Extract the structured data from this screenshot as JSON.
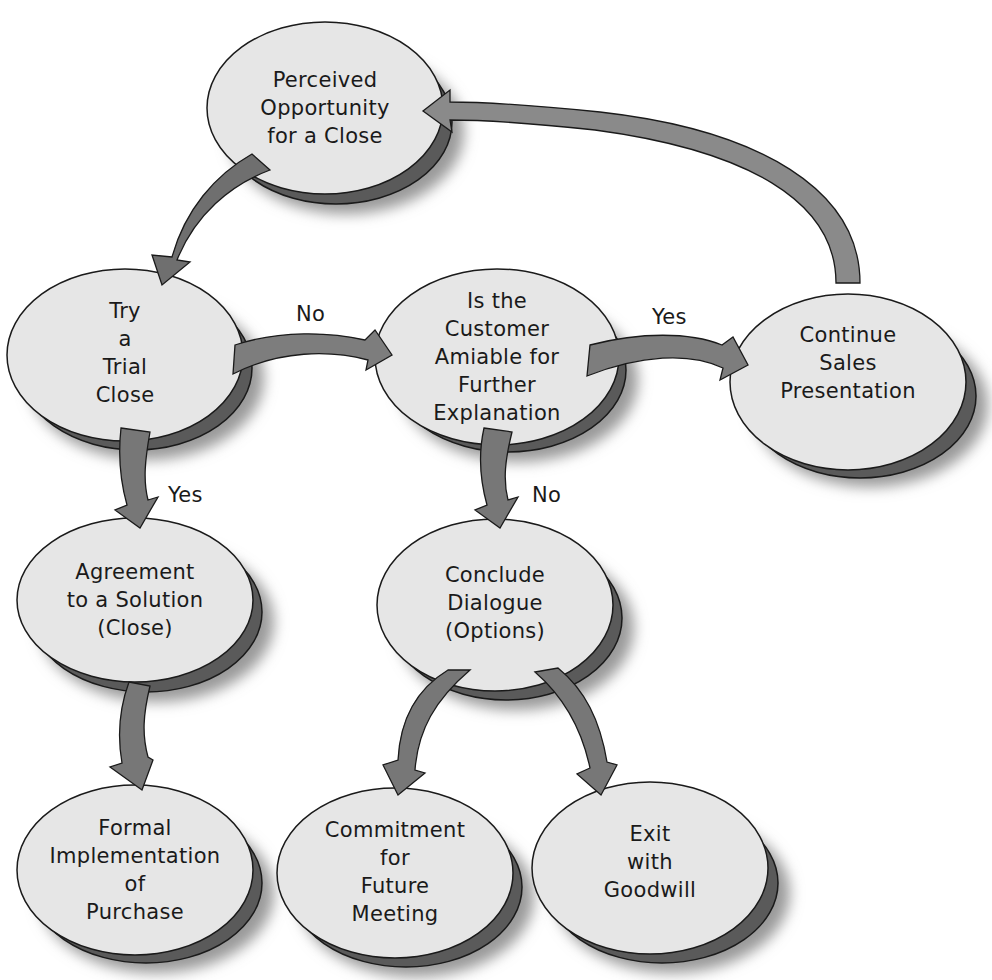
{
  "diagram": {
    "type": "flowchart",
    "colors": {
      "node_fill": "#e6e6e6",
      "node_shadow": "#5a5a5a",
      "arrow_fill": "#7a7a7a",
      "stroke": "#1a1a1a",
      "text": "#1a1a1a"
    },
    "nodes": {
      "perceived": {
        "lines": [
          "Perceived",
          "Opportunity",
          "for a Close"
        ]
      },
      "trial": {
        "lines": [
          "Try",
          "a",
          "Trial",
          "Close"
        ]
      },
      "amiable": {
        "lines": [
          "Is the",
          "Customer",
          "Amiable for",
          "Further",
          "Explanation"
        ]
      },
      "continue": {
        "lines": [
          "Continue",
          "Sales",
          "Presentation"
        ]
      },
      "agreement": {
        "lines": [
          "Agreement",
          "to a Solution",
          "(Close)"
        ]
      },
      "conclude": {
        "lines": [
          "Conclude",
          "Dialogue",
          "(Options)"
        ]
      },
      "formal": {
        "lines": [
          "Formal",
          "Implementation",
          "of",
          "Purchase"
        ]
      },
      "commitment": {
        "lines": [
          "Commitment",
          "for",
          "Future",
          "Meeting"
        ]
      },
      "exit": {
        "lines": [
          "Exit",
          "with",
          "Goodwill"
        ]
      }
    },
    "edges": {
      "trial_to_amiable": {
        "label": "No"
      },
      "amiable_to_continue": {
        "label": "Yes"
      },
      "trial_to_agreement": {
        "label": "Yes"
      },
      "amiable_to_conclude": {
        "label": "No"
      },
      "perceived_to_trial": {
        "label": ""
      },
      "continue_to_perceived": {
        "label": ""
      },
      "agreement_to_formal": {
        "label": ""
      },
      "conclude_to_commitment": {
        "label": ""
      },
      "conclude_to_exit": {
        "label": ""
      }
    }
  }
}
